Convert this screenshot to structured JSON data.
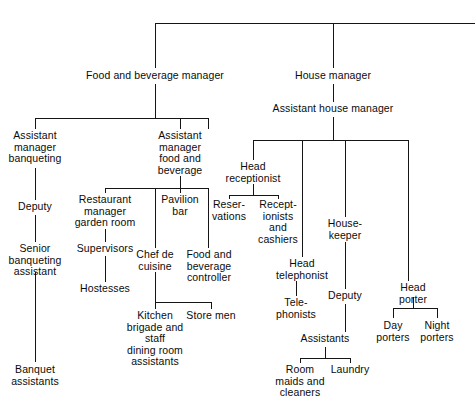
{
  "chart_data": {
    "type": "diagram",
    "diagram_kind": "organizational-chart",
    "title": "",
    "orientation": "top-down",
    "root_label": "",
    "nodes": [
      {
        "id": "fb_manager",
        "label": "Food and beverage manager",
        "x": 155,
        "y": 70,
        "level": 1
      },
      {
        "id": "house_manager",
        "label": "House manager",
        "x": 333,
        "y": 70,
        "level": 1
      },
      {
        "id": "asst_house_manager",
        "label": "Assistant house manager",
        "x": 333,
        "y": 103,
        "level": 2
      },
      {
        "id": "asst_mgr_banqueting",
        "label": "Assistant\nmanager\nbanqueting",
        "x": 35,
        "y": 130,
        "level": 2
      },
      {
        "id": "asst_mgr_fb",
        "label": "Assistant\nmanager\nfood and\nbeverage",
        "x": 180,
        "y": 130,
        "level": 2
      },
      {
        "id": "head_receptionist",
        "label": "Head\nreceptionist",
        "x": 253,
        "y": 161,
        "level": 3
      },
      {
        "id": "deputy_banqueting",
        "label": "Deputy",
        "x": 35,
        "y": 201,
        "level": 3
      },
      {
        "id": "restaurant_manager",
        "label": "Restaurant\nmanager\ngarden room",
        "x": 105,
        "y": 194,
        "level": 3
      },
      {
        "id": "pavilion_bar",
        "label": "Pavilion\nbar",
        "x": 180,
        "y": 194,
        "level": 3
      },
      {
        "id": "reservations",
        "label": "Reser-\nvations",
        "x": 229,
        "y": 199,
        "level": 4
      },
      {
        "id": "receptionists_cashiers",
        "label": "Recept-\nionists\nand\ncashiers",
        "x": 278,
        "y": 199,
        "level": 4
      },
      {
        "id": "housekeeper",
        "label": "House-\nkeeper",
        "x": 345,
        "y": 218,
        "level": 3
      },
      {
        "id": "supervisors",
        "label": "Supervisors",
        "x": 105,
        "y": 243,
        "level": 4
      },
      {
        "id": "chef_de_cuisine",
        "label": "Chef de\ncuisine",
        "x": 155,
        "y": 249,
        "level": 4
      },
      {
        "id": "fb_controller",
        "label": "Food and\nbeverage\ncontroller",
        "x": 209,
        "y": 249,
        "level": 4
      },
      {
        "id": "senior_banq_asst",
        "label": "Senior\nbanqueting\nassistant",
        "x": 35,
        "y": 243,
        "level": 4
      },
      {
        "id": "head_telephonist",
        "label": "Head\ntelephonist",
        "x": 302,
        "y": 258,
        "level": 4
      },
      {
        "id": "head_porter",
        "label": "Head\nporter",
        "x": 413,
        "y": 282,
        "level": 4
      },
      {
        "id": "hostesses",
        "label": "Hostesses",
        "x": 105,
        "y": 283,
        "level": 5
      },
      {
        "id": "deputy_housekeeper",
        "label": "Deputy",
        "x": 345,
        "y": 290,
        "level": 4
      },
      {
        "id": "telephonists",
        "label": "Tele-\nphonists",
        "x": 296,
        "y": 297,
        "level": 5
      },
      {
        "id": "kitchen_brigade",
        "label": "Kitchen\nbrigade and\nstaff\ndining room\nassistants",
        "x": 155,
        "y": 310,
        "level": 5
      },
      {
        "id": "store_men",
        "label": "Store men",
        "x": 211,
        "y": 310,
        "level": 5
      },
      {
        "id": "day_porters",
        "label": "Day\nporters",
        "x": 393,
        "y": 320,
        "level": 5
      },
      {
        "id": "night_porters",
        "label": "Night\nporters",
        "x": 437,
        "y": 320,
        "level": 5
      },
      {
        "id": "assistants",
        "label": "Assistants",
        "x": 325,
        "y": 333,
        "level": 5
      },
      {
        "id": "room_maids_cleaners",
        "label": "Room\nmaids and\ncleaners",
        "x": 300,
        "y": 364,
        "level": 6
      },
      {
        "id": "laundry",
        "label": "Laundry",
        "x": 350,
        "y": 364,
        "level": 6
      },
      {
        "id": "banquet_assistants",
        "label": "Banquet\nassistants",
        "x": 35,
        "y": 364,
        "level": 5
      }
    ],
    "edges": [
      {
        "from": "root",
        "to": "fb_manager",
        "kind": "top-bus"
      },
      {
        "from": "root",
        "to": "house_manager",
        "kind": "top-bus"
      },
      {
        "from": "fb_manager",
        "to": "asst_mgr_banqueting",
        "kind": "bus"
      },
      {
        "from": "fb_manager",
        "to": "asst_mgr_fb",
        "kind": "bus"
      },
      {
        "from": "house_manager",
        "to": "asst_house_manager",
        "kind": "straight"
      },
      {
        "from": "asst_house_manager",
        "to": "head_receptionist",
        "kind": "bus"
      },
      {
        "from": "asst_house_manager",
        "to": "head_telephonist",
        "kind": "bus"
      },
      {
        "from": "asst_house_manager",
        "to": "housekeeper",
        "kind": "bus"
      },
      {
        "from": "asst_house_manager",
        "to": "head_porter",
        "kind": "bus"
      },
      {
        "from": "asst_mgr_banqueting",
        "to": "deputy_banqueting",
        "kind": "straight"
      },
      {
        "from": "deputy_banqueting",
        "to": "senior_banq_asst",
        "kind": "straight"
      },
      {
        "from": "senior_banq_asst",
        "to": "banquet_assistants",
        "kind": "straight"
      },
      {
        "from": "asst_mgr_fb",
        "to": "restaurant_manager",
        "kind": "bus"
      },
      {
        "from": "asst_mgr_fb",
        "to": "chef_de_cuisine",
        "kind": "bus"
      },
      {
        "from": "asst_mgr_fb",
        "to": "pavilion_bar",
        "kind": "bus"
      },
      {
        "from": "asst_mgr_fb",
        "to": "fb_controller",
        "kind": "bus"
      },
      {
        "from": "restaurant_manager",
        "to": "supervisors",
        "kind": "straight"
      },
      {
        "from": "supervisors",
        "to": "hostesses",
        "kind": "straight"
      },
      {
        "from": "chef_de_cuisine",
        "to": "kitchen_brigade",
        "kind": "bus"
      },
      {
        "from": "chef_de_cuisine",
        "to": "store_men",
        "kind": "bus"
      },
      {
        "from": "head_receptionist",
        "to": "reservations",
        "kind": "bus"
      },
      {
        "from": "head_receptionist",
        "to": "receptionists_cashiers",
        "kind": "bus"
      },
      {
        "from": "head_telephonist",
        "to": "telephonists",
        "kind": "straight"
      },
      {
        "from": "housekeeper",
        "to": "deputy_housekeeper",
        "kind": "straight"
      },
      {
        "from": "deputy_housekeeper",
        "to": "assistants",
        "kind": "straight"
      },
      {
        "from": "assistants",
        "to": "room_maids_cleaners",
        "kind": "bus"
      },
      {
        "from": "assistants",
        "to": "laundry",
        "kind": "bus"
      },
      {
        "from": "head_porter",
        "to": "day_porters",
        "kind": "bus"
      },
      {
        "from": "head_porter",
        "to": "night_porters",
        "kind": "bus"
      }
    ],
    "line_color": "#151515",
    "background_color": "#ffffff"
  }
}
